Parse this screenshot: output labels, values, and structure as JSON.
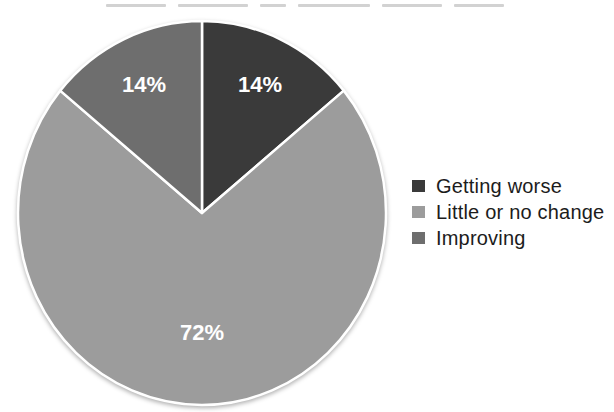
{
  "chart_data": {
    "type": "pie",
    "slices": [
      {
        "label": "Getting worse",
        "value": 14,
        "display_label": "14%",
        "color": "#3a3a3a"
      },
      {
        "label": "Little or no change",
        "value": 72,
        "display_label": "72%",
        "color": "#9c9c9c"
      },
      {
        "label": "Improving",
        "value": 14,
        "display_label": "14%",
        "color": "#6e6e6e"
      }
    ],
    "start_angle_deg": 0,
    "direction": "clockwise",
    "legend_position": "right",
    "slice_label_color": "#ffffff",
    "separator_color": "#ffffff",
    "legend_text_color": "#1c1c1c"
  }
}
